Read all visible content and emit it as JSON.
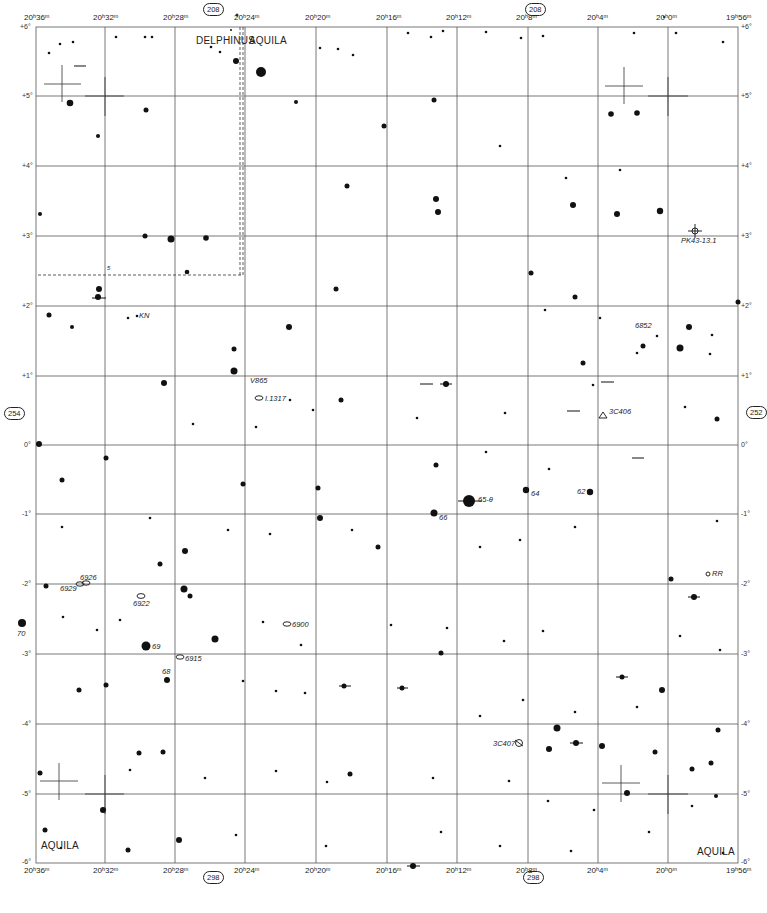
{
  "chart": {
    "type": "star-atlas-chart",
    "constellations": [
      "DELPHINUS",
      "AQUILA"
    ],
    "page_refs": {
      "top": "208",
      "bottom": "298",
      "left": "254",
      "right": "252"
    },
    "constellation_labels": {
      "delphinus": "DELPHINUS",
      "aquila_top": "AQUILA",
      "aquila_bl": "AQUILA",
      "aquila_br": "AQUILA"
    },
    "ra_labels": [
      "20ʰ36ᵐ",
      "20ʰ32ᵐ",
      "20ʰ28ᵐ",
      "20ʰ24ᵐ",
      "20ʰ20ᵐ",
      "20ʰ16ᵐ",
      "20ʰ12ᵐ",
      "20ʰ8ᵐ",
      "20ʰ4ᵐ",
      "20ʰ0ᵐ",
      "19ʰ56ᵐ"
    ],
    "dec_labels": [
      "+6°",
      "+5°",
      "+4°",
      "+3°",
      "+2°",
      "+1°",
      "0°",
      "-1°",
      "-2°",
      "-3°",
      "-4°",
      "-5°",
      "-6°"
    ],
    "objects": [
      {
        "id": "kn",
        "label": "KN",
        "type": "variable"
      },
      {
        "id": "v865",
        "label": "V865",
        "type": "variable"
      },
      {
        "id": "i1317",
        "label": "I.1317",
        "type": "galaxy"
      },
      {
        "id": "pk43",
        "label": "PK43-13.1",
        "type": "planetary-nebula"
      },
      {
        "id": "n6852",
        "label": "6852",
        "type": "planetary-nebula"
      },
      {
        "id": "3c406",
        "label": "3C406",
        "type": "radio-source"
      },
      {
        "id": "65theta",
        "label": "65-θ",
        "type": "star"
      },
      {
        "id": "s64",
        "label": "64",
        "type": "star"
      },
      {
        "id": "s62",
        "label": "62",
        "type": "star"
      },
      {
        "id": "s66",
        "label": "66",
        "type": "star"
      },
      {
        "id": "rr",
        "label": "RR",
        "type": "variable"
      },
      {
        "id": "n6926",
        "label": "6926",
        "type": "galaxy"
      },
      {
        "id": "n6929",
        "label": "6929",
        "type": "galaxy"
      },
      {
        "id": "n6922",
        "label": "6922",
        "type": "galaxy"
      },
      {
        "id": "s70",
        "label": "70",
        "type": "star"
      },
      {
        "id": "s69",
        "label": "69",
        "type": "star"
      },
      {
        "id": "n6900",
        "label": "6900",
        "type": "galaxy"
      },
      {
        "id": "n6915",
        "label": "6915",
        "type": "galaxy"
      },
      {
        "id": "s68",
        "label": "68",
        "type": "star"
      },
      {
        "id": "3c407",
        "label": "3C407",
        "type": "radio-source"
      },
      {
        "id": "s5",
        "label": "5",
        "type": "star"
      }
    ]
  }
}
